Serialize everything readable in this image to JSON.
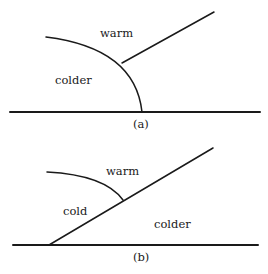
{
  "diagram": {
    "line_color": "#1a1a1a",
    "background": "#ffffff",
    "panels": [
      {
        "id": "a",
        "caption": "(a)",
        "labels": {
          "upper": "warm",
          "left": "colder"
        }
      },
      {
        "id": "b",
        "caption": "(b)",
        "labels": {
          "upper": "warm",
          "left": "cold",
          "right": "colder"
        }
      }
    ]
  }
}
